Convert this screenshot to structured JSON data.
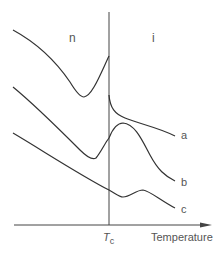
{
  "diagram": {
    "regions": {
      "left": "n",
      "right": "i"
    },
    "curves": [
      {
        "id": "a",
        "label": "a"
      },
      {
        "id": "b",
        "label": "b"
      },
      {
        "id": "c",
        "label": "c"
      }
    ],
    "axis": {
      "x_label": "Temperature",
      "critical_mark": "T",
      "critical_sub": "c"
    }
  }
}
